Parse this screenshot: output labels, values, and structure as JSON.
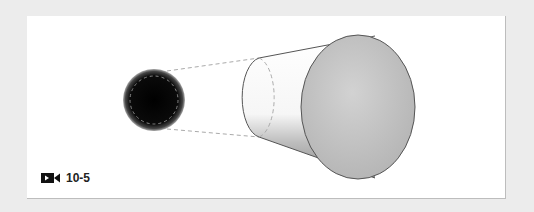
{
  "figure": {
    "caption": "10-5",
    "caption_icon": "video-camera-icon",
    "colors": {
      "background": "#ececec",
      "panel": "#ffffff",
      "lens_dark": "#050505",
      "cylinder_end": "#c4c4c4",
      "outline": "#555555",
      "dashed": "#aaaaaa"
    }
  }
}
